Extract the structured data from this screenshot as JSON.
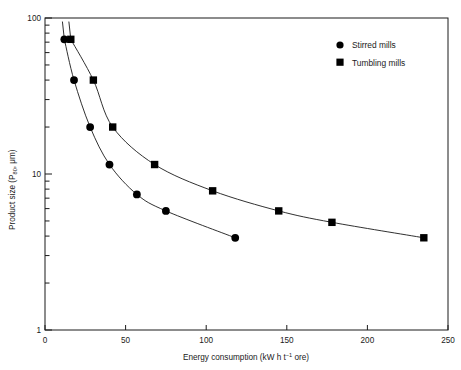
{
  "chart_data": {
    "type": "line",
    "title": "",
    "xlabel": "Energy consumption (kW h t-1 ore)",
    "xlabel_main": "Energy consumption (kW h t",
    "xlabel_exp": "−1",
    "xlabel_tail": " ore)",
    "ylabel": "Product size (P80, μm)",
    "ylabel_main": "Product size (P",
    "ylabel_sub": "80",
    "ylabel_tail": ", μm)",
    "xlim": [
      0,
      250
    ],
    "ylim": [
      1,
      100
    ],
    "yscale": "log",
    "xscale": "linear",
    "grid": false,
    "xticks": [
      0,
      50,
      100,
      150,
      200,
      250
    ],
    "xtick_labels": [
      "0",
      "50",
      "100",
      "150",
      "200",
      "250"
    ],
    "yticks": [
      1,
      10,
      100
    ],
    "ytick_labels": [
      "1",
      "10",
      "100"
    ],
    "y_minor_ticks": [
      2,
      3,
      4,
      5,
      6,
      7,
      8,
      9,
      20,
      30,
      40,
      50,
      60,
      70,
      80,
      90
    ],
    "legend_position": "top-right",
    "series": [
      {
        "name": "Stirred mills",
        "marker": "circle",
        "color": "#000000",
        "points": [
          {
            "x": 12,
            "y": 73
          },
          {
            "x": 18,
            "y": 40
          },
          {
            "x": 28,
            "y": 20
          },
          {
            "x": 40,
            "y": 11.5
          },
          {
            "x": 57,
            "y": 7.4
          },
          {
            "x": 75,
            "y": 5.8
          },
          {
            "x": 118,
            "y": 3.9
          }
        ]
      },
      {
        "name": "Tumbling mills",
        "marker": "square",
        "color": "#000000",
        "points": [
          {
            "x": 16,
            "y": 73
          },
          {
            "x": 30,
            "y": 40
          },
          {
            "x": 42,
            "y": 20
          },
          {
            "x": 68,
            "y": 11.5
          },
          {
            "x": 104,
            "y": 7.8
          },
          {
            "x": 145,
            "y": 5.8
          },
          {
            "x": 178,
            "y": 4.9
          },
          {
            "x": 235,
            "y": 3.9
          }
        ]
      }
    ]
  },
  "legend": {
    "items": [
      {
        "label": "Stirred mills",
        "marker": "circle"
      },
      {
        "label": "Tumbling mills",
        "marker": "square"
      }
    ]
  }
}
